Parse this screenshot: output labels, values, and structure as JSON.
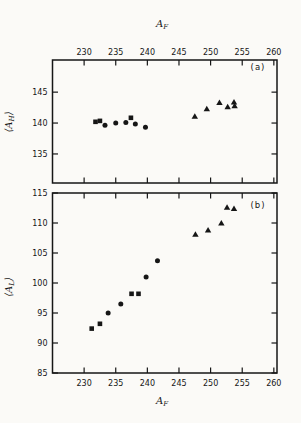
{
  "figure": {
    "background": "#fbfaf7",
    "ink": "#161616",
    "top_axis_label": {
      "main": "A",
      "sub": "F",
      "text": "A_F"
    },
    "bottom_axis_label": {
      "main": "A",
      "sub": "F",
      "text": "A_F"
    }
  },
  "chart_data": [
    {
      "panel": "a",
      "type": "scatter",
      "annotation": "(a)",
      "xlabel": "A_F",
      "ylabel": "⟨A_H⟩",
      "ylabel_parts": {
        "open": "⟨",
        "main": "A",
        "sub": "H",
        "close": "⟩"
      },
      "xlim": [
        225,
        260.5
      ],
      "ylim": [
        130.3,
        150.2
      ],
      "xticks": [
        230,
        235,
        240,
        245,
        250,
        255,
        260
      ],
      "yticks": [
        135,
        140,
        145
      ],
      "grid": false,
      "legend": null,
      "series": [
        {
          "name": "squares",
          "marker": "square",
          "points": [
            [
              231.8,
              140.2
            ],
            [
              232.5,
              140.35
            ],
            [
              237.4,
              140.85
            ]
          ]
        },
        {
          "name": "circles",
          "marker": "circle",
          "points": [
            [
              233.3,
              139.65
            ],
            [
              235.0,
              140.0
            ],
            [
              236.6,
              140.1
            ],
            [
              238.1,
              139.85
            ],
            [
              239.7,
              139.3
            ]
          ]
        },
        {
          "name": "triangles",
          "marker": "triangle",
          "points": [
            [
              247.5,
              141.1
            ],
            [
              249.4,
              142.3
            ],
            [
              251.4,
              143.3
            ],
            [
              252.7,
              142.6
            ],
            [
              253.7,
              143.4
            ],
            [
              253.8,
              142.8
            ]
          ]
        }
      ]
    },
    {
      "panel": "b",
      "type": "scatter",
      "annotation": "(b)",
      "xlabel": "A_F",
      "ylabel": "⟨A_L⟩",
      "ylabel_parts": {
        "open": "⟨",
        "main": "A",
        "sub": "L",
        "close": "⟩"
      },
      "xlim": [
        225,
        260.5
      ],
      "ylim": [
        85,
        115
      ],
      "xticks": [
        230,
        235,
        240,
        245,
        250,
        255,
        260
      ],
      "yticks": [
        85,
        90,
        95,
        100,
        105,
        110,
        115
      ],
      "grid": false,
      "legend": null,
      "series": [
        {
          "name": "squares",
          "marker": "square",
          "points": [
            [
              231.2,
              92.4
            ],
            [
              232.5,
              93.2
            ],
            [
              237.5,
              98.2
            ],
            [
              238.6,
              98.2
            ]
          ]
        },
        {
          "name": "circles",
          "marker": "circle",
          "points": [
            [
              233.8,
              95.0
            ],
            [
              235.8,
              96.5
            ],
            [
              239.8,
              101.0
            ],
            [
              241.6,
              103.7
            ]
          ]
        },
        {
          "name": "triangles",
          "marker": "triangle",
          "points": [
            [
              247.6,
              108.1
            ],
            [
              249.6,
              108.8
            ],
            [
              251.7,
              110.0
            ],
            [
              252.6,
              112.6
            ],
            [
              253.7,
              112.4
            ]
          ]
        }
      ]
    }
  ]
}
